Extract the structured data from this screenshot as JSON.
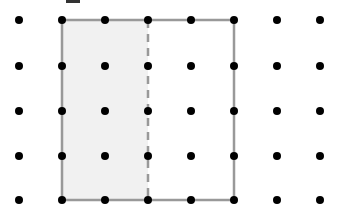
{
  "diagram": {
    "type": "dot-grid-geometry",
    "grid": {
      "columns": 8,
      "rows": 5,
      "x_positions": [
        19,
        62,
        105,
        148,
        191,
        234,
        277,
        320
      ],
      "y_positions": [
        20,
        66,
        111,
        156,
        200
      ],
      "dot_radius": 4,
      "dot_color": "#000000"
    },
    "square": {
      "from_col": 1,
      "to_col": 5,
      "from_row": 0,
      "to_row": 4,
      "stroke_color": "#999999",
      "stroke_width": 2.5
    },
    "shaded_region": {
      "from_col": 1,
      "to_col": 3,
      "from_row": 0,
      "to_row": 4,
      "fill_color": "#f1f1f1",
      "label": "half of square shaded"
    },
    "dashed_divider": {
      "col": 3,
      "from_row": 0,
      "to_row": 4,
      "stroke_color": "#999999",
      "dash": "8,6"
    },
    "top_mark": {
      "x": 62,
      "y": 2,
      "width": 14,
      "color": "#333333"
    }
  }
}
